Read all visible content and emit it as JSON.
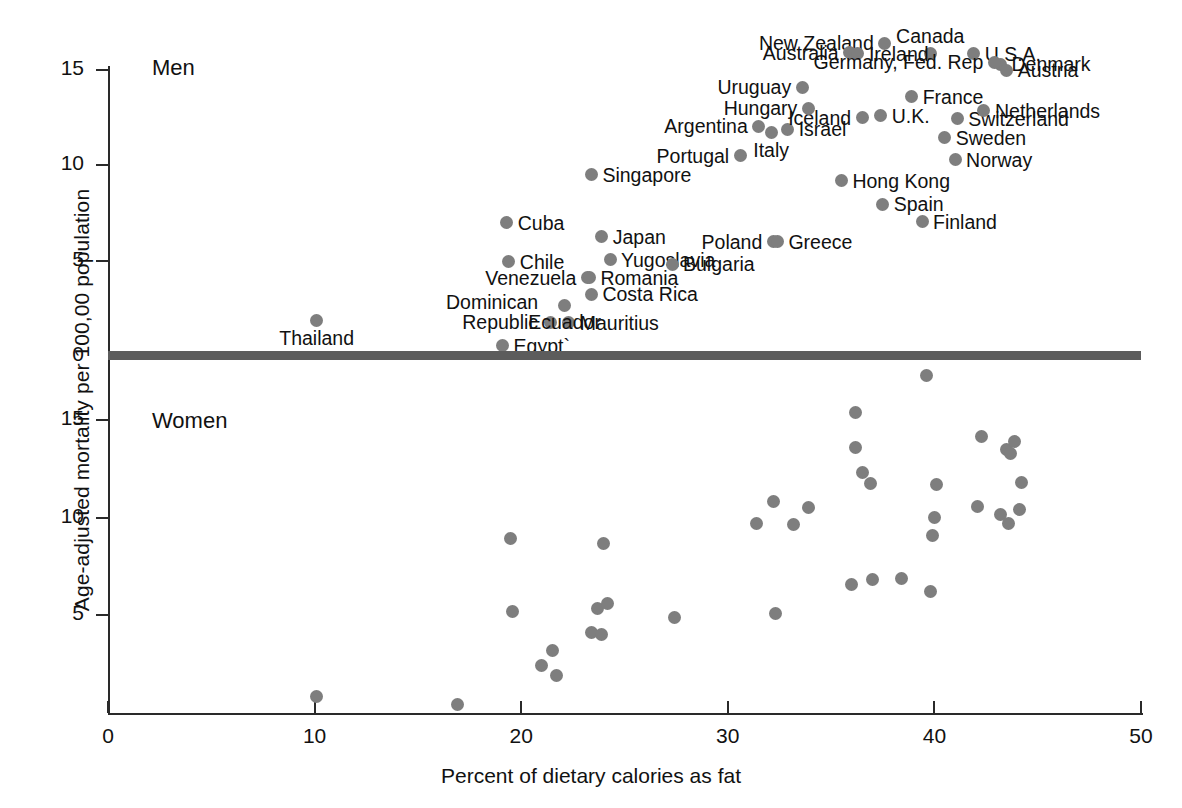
{
  "chart_data": {
    "type": "scatter",
    "title": "",
    "xlabel": "Percent of dietary calories as fat",
    "ylabel": "Age-adjusted mortality per 100,00 population",
    "xlim": [
      0,
      50
    ],
    "xticks": [
      0,
      10,
      20,
      30,
      40,
      50
    ],
    "grid": false,
    "legend": "none",
    "panels": [
      {
        "name": "Men",
        "label": "Men",
        "ylim": [
          0,
          16.5
        ],
        "yticks": [
          0,
          5,
          10,
          15
        ],
        "points": [
          {
            "label": "Thailand",
            "x": 10.1,
            "y": 1.85,
            "lab_pos": "below"
          },
          {
            "label": "Egypt`",
            "x": 19.1,
            "y": 0.55,
            "lab_pos": "right"
          },
          {
            "label": "Dominican Republic",
            "x": 21.4,
            "y": 1.75,
            "lab_pos": "left2"
          },
          {
            "label": "Mauritius",
            "x": 22.3,
            "y": 1.75,
            "lab_pos": "right"
          },
          {
            "label": "Ecuador",
            "x": 22.1,
            "y": 2.65,
            "lab_pos": "below"
          },
          {
            "label": "Chile",
            "x": 19.4,
            "y": 4.95,
            "lab_pos": "right"
          },
          {
            "label": "Cuba",
            "x": 19.3,
            "y": 7.0,
            "lab_pos": "right"
          },
          {
            "label": "Venezuela",
            "x": 23.2,
            "y": 4.1,
            "lab_pos": "left"
          },
          {
            "label": "Romania",
            "x": 23.3,
            "y": 4.1,
            "lab_pos": "right"
          },
          {
            "label": "Costa Rica",
            "x": 23.4,
            "y": 3.25,
            "lab_pos": "right"
          },
          {
            "label": "Japan",
            "x": 23.9,
            "y": 6.25,
            "lab_pos": "right"
          },
          {
            "label": "Yugoslavia",
            "x": 24.3,
            "y": 5.05,
            "lab_pos": "right"
          },
          {
            "label": "Singapore",
            "x": 23.4,
            "y": 9.5,
            "lab_pos": "right"
          },
          {
            "label": "Bulgaria",
            "x": 27.3,
            "y": 4.8,
            "lab_pos": "right"
          },
          {
            "label": "Poland",
            "x": 32.2,
            "y": 6.0,
            "lab_pos": "left"
          },
          {
            "label": "Greece",
            "x": 32.4,
            "y": 6.0,
            "lab_pos": "right"
          },
          {
            "label": "Portugal",
            "x": 30.6,
            "y": 10.5,
            "lab_pos": "left"
          },
          {
            "label": "Italy",
            "x": 32.1,
            "y": 11.7,
            "lab_pos": "below"
          },
          {
            "label": "Israel",
            "x": 32.9,
            "y": 11.9,
            "lab_pos": "right"
          },
          {
            "label": "Argentina",
            "x": 31.5,
            "y": 12.05,
            "lab_pos": "left"
          },
          {
            "label": "Hong Kong",
            "x": 35.5,
            "y": 9.2,
            "lab_pos": "right"
          },
          {
            "label": "Spain",
            "x": 37.5,
            "y": 7.95,
            "lab_pos": "right"
          },
          {
            "label": "Finland",
            "x": 39.4,
            "y": 7.05,
            "lab_pos": "right"
          },
          {
            "label": "Iceland",
            "x": 36.5,
            "y": 12.5,
            "lab_pos": "left"
          },
          {
            "label": "U.K.",
            "x": 37.4,
            "y": 12.6,
            "lab_pos": "right"
          },
          {
            "label": "Hungary",
            "x": 33.9,
            "y": 13.0,
            "lab_pos": "left"
          },
          {
            "label": "Uruguay",
            "x": 33.6,
            "y": 14.1,
            "lab_pos": "left"
          },
          {
            "label": "France",
            "x": 38.9,
            "y": 13.6,
            "lab_pos": "right"
          },
          {
            "label": "Sweden",
            "x": 40.5,
            "y": 11.45,
            "lab_pos": "right"
          },
          {
            "label": "Norway",
            "x": 41.0,
            "y": 10.3,
            "lab_pos": "right"
          },
          {
            "label": "Switzerland",
            "x": 41.1,
            "y": 12.45,
            "lab_pos": "right"
          },
          {
            "label": "Netherlands",
            "x": 42.4,
            "y": 12.85,
            "lab_pos": "right"
          },
          {
            "label": "Canada",
            "x": 39.8,
            "y": 15.85,
            "lab_pos": "above"
          },
          {
            "label": "U.S.A.",
            "x": 41.9,
            "y": 15.85,
            "lab_pos": "right"
          },
          {
            "label": "Denmark",
            "x": 43.2,
            "y": 15.3,
            "lab_pos": "right"
          },
          {
            "label": "Austria",
            "x": 43.5,
            "y": 15.0,
            "lab_pos": "right"
          },
          {
            "label": "New Zealand",
            "x": 37.6,
            "y": 16.4,
            "lab_pos": "left"
          },
          {
            "label": "Australia",
            "x": 35.9,
            "y": 15.9,
            "lab_pos": "left"
          },
          {
            "label": "Ireland",
            "x": 36.3,
            "y": 15.85,
            "lab_pos": "right"
          },
          {
            "label": "Germany, Fed. Rep",
            "x": 42.9,
            "y": 15.4,
            "lab_pos": "left"
          }
        ]
      },
      {
        "name": "Women",
        "label": "Women",
        "ylim": [
          0,
          18
        ],
        "yticks": [
          5,
          10,
          15
        ],
        "points": [
          {
            "x": 10.1,
            "y": 0.85
          },
          {
            "x": 16.9,
            "y": 0.45
          },
          {
            "x": 19.5,
            "y": 8.95
          },
          {
            "x": 19.6,
            "y": 5.2
          },
          {
            "x": 21.0,
            "y": 2.45
          },
          {
            "x": 21.5,
            "y": 3.2
          },
          {
            "x": 21.7,
            "y": 1.9
          },
          {
            "x": 23.4,
            "y": 4.1
          },
          {
            "x": 23.7,
            "y": 5.35
          },
          {
            "x": 23.9,
            "y": 4.0
          },
          {
            "x": 24.2,
            "y": 5.6
          },
          {
            "x": 24.0,
            "y": 8.7
          },
          {
            "x": 27.4,
            "y": 4.9
          },
          {
            "x": 31.4,
            "y": 9.7
          },
          {
            "x": 32.3,
            "y": 5.1
          },
          {
            "x": 32.2,
            "y": 10.85
          },
          {
            "x": 33.2,
            "y": 9.65
          },
          {
            "x": 33.9,
            "y": 10.5
          },
          {
            "x": 36.0,
            "y": 6.6
          },
          {
            "x": 36.2,
            "y": 15.4
          },
          {
            "x": 36.2,
            "y": 13.6
          },
          {
            "x": 36.5,
            "y": 12.3
          },
          {
            "x": 36.9,
            "y": 11.75
          },
          {
            "x": 37.0,
            "y": 6.85
          },
          {
            "x": 38.4,
            "y": 6.9
          },
          {
            "x": 39.6,
            "y": 17.3
          },
          {
            "x": 39.8,
            "y": 6.2
          },
          {
            "x": 40.1,
            "y": 11.7
          },
          {
            "x": 40.0,
            "y": 10.0
          },
          {
            "x": 39.9,
            "y": 9.1
          },
          {
            "x": 42.1,
            "y": 10.55
          },
          {
            "x": 42.3,
            "y": 14.15
          },
          {
            "x": 43.2,
            "y": 10.15
          },
          {
            "x": 43.5,
            "y": 13.5
          },
          {
            "x": 43.6,
            "y": 9.7
          },
          {
            "x": 43.9,
            "y": 13.9
          },
          {
            "x": 43.7,
            "y": 13.3
          },
          {
            "x": 44.2,
            "y": 11.8
          },
          {
            "x": 44.1,
            "y": 10.4
          }
        ]
      }
    ]
  },
  "axes": {
    "x_tick_labels": [
      "0",
      "10",
      "20",
      "30",
      "40",
      "50"
    ],
    "y_tick_labels_men": [
      "0",
      "5",
      "10",
      "15"
    ],
    "y_tick_labels_women": [
      "5",
      "10",
      "15"
    ],
    "x_title": "Percent of dietary calories as fat",
    "y_title": "Age-adjusted mortality per 100,00 population"
  },
  "panel_labels": {
    "men": "Men",
    "women": "Women"
  },
  "colors": {
    "point": "#7e7e7e",
    "axis": "#2a2a2a",
    "divider": "#5c5c5c",
    "text": "#111111",
    "background": "#ffffff"
  }
}
